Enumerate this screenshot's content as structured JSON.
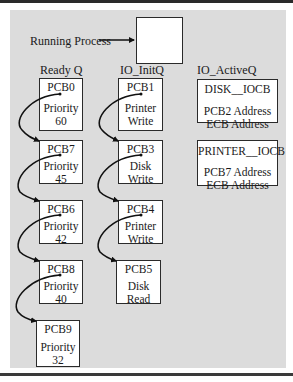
{
  "running": {
    "label": "Running Process"
  },
  "columns": {
    "ready": {
      "header": "Ready Q"
    },
    "init": {
      "header": "IO_InitQ"
    },
    "active": {
      "header": "IO_ActiveQ"
    }
  },
  "ready_queue": [
    {
      "id": "PCB0",
      "line1": "Priority",
      "line2": "60"
    },
    {
      "id": "PCB7",
      "line1": "Priority",
      "line2": "45"
    },
    {
      "id": "PCB6",
      "line1": "Priority",
      "line2": "42"
    },
    {
      "id": "PCB8",
      "line1": "Priority",
      "line2": "40"
    },
    {
      "id": "PCB9",
      "line1": "Priority",
      "line2": "32"
    }
  ],
  "io_init_queue": [
    {
      "id": "PCB1",
      "line1": "Printer",
      "line2": "Write"
    },
    {
      "id": "PCB3",
      "line1": "Disk",
      "line2": "Write"
    },
    {
      "id": "PCB4",
      "line1": "Printer",
      "line2": "Write"
    },
    {
      "id": "PCB5",
      "line1": "Disk",
      "line2": "Read"
    }
  ],
  "io_active_queue": [
    {
      "id": "DISK__IOCB",
      "line1": "PCB2 Address",
      "line2": "ECB Address"
    },
    {
      "id": "PRINTER__IOCB",
      "line1": "PCB7 Address",
      "line2": "ECB Address"
    }
  ],
  "colors": {
    "panel": "#dcdcdc",
    "box": "#ffffff",
    "ink": "#1a1a1a"
  }
}
